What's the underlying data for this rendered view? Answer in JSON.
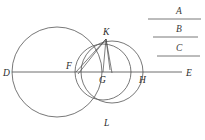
{
  "figure": {
    "type": "geometry-diagram",
    "points": [
      {
        "id": "D",
        "label": "D",
        "x": 12,
        "y": 72,
        "label_x": 3,
        "label_y": 76
      },
      {
        "id": "F",
        "label": "F",
        "x": 76,
        "y": 72,
        "label_x": 66,
        "label_y": 69
      },
      {
        "id": "G",
        "label": "G",
        "x": 103,
        "y": 72,
        "label_x": 99,
        "label_y": 83
      },
      {
        "id": "H",
        "label": "H",
        "x": 142,
        "y": 72,
        "label_x": 139,
        "label_y": 83
      },
      {
        "id": "E",
        "label": "E",
        "x": 178,
        "y": 72,
        "label_x": 178,
        "label_y": 76
      },
      {
        "id": "K",
        "label": "K",
        "x": 106,
        "y": 39,
        "label_x": 103,
        "label_y": 35
      },
      {
        "id": "L",
        "label": "L",
        "x": 106,
        "y": 113,
        "label_x": 104,
        "label_y": 126
      }
    ],
    "circles": [
      {
        "id": "large-left-circle",
        "cx": 57,
        "cy": 72,
        "r": 45
      },
      {
        "id": "middle-circle",
        "cx": 103,
        "cy": 72,
        "r": 28
      },
      {
        "id": "right-circle",
        "cx": 112,
        "cy": 72,
        "r": 31
      }
    ],
    "axis": {
      "id": "line-DE",
      "x1": 12,
      "y1": 72,
      "x2": 182,
      "y2": 72
    },
    "chords": [
      {
        "id": "chord-KF",
        "x1": 106,
        "y1": 39,
        "x2": 76,
        "y2": 72
      },
      {
        "id": "chord-KG",
        "x1": 106,
        "y1": 39,
        "x2": 103,
        "y2": 72
      },
      {
        "id": "chord-KH-inner",
        "x1": 106,
        "y1": 39,
        "x2": 110,
        "y2": 70
      },
      {
        "id": "chord-KF-second",
        "x1": 106,
        "y1": 39,
        "x2": 78,
        "y2": 74
      },
      {
        "id": "chord-K-down",
        "x1": 106,
        "y1": 39,
        "x2": 112,
        "y2": 73
      }
    ]
  },
  "segments": {
    "items": [
      {
        "id": "segment-A",
        "label": "A",
        "label_x": 176,
        "label_y": 14,
        "line_x1": 148,
        "line_x2": 201,
        "line_y": 19
      },
      {
        "id": "segment-B",
        "label": "B",
        "label_x": 176,
        "label_y": 32,
        "line_x1": 153,
        "line_x2": 198,
        "line_y": 37
      },
      {
        "id": "segment-C",
        "label": "C",
        "label_x": 176,
        "label_y": 51,
        "line_x1": 157,
        "line_x2": 200,
        "line_y": 56
      }
    ]
  },
  "colors": {
    "ink": "#4a4a4a",
    "label_ink": "#2b2b2b",
    "background": "#ffffff"
  }
}
